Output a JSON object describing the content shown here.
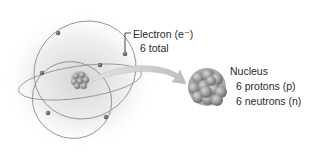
{
  "diagram": {
    "electron_label": {
      "title": "Electron (e⁻)",
      "count": "6 total"
    },
    "nucleus_label": {
      "title": "Nucleus",
      "protons": "6 protons (p)",
      "neutrons": "6 neutrons (n)"
    },
    "colors": {
      "orbit": "#8a8a8a",
      "electron": "#6b6b6b",
      "nucleus_particle": "#9a9a9a",
      "arrow": "#c4c4c4",
      "glow": "#d9d9d9",
      "text": "#2a2a2a"
    },
    "electrons_count": 6
  }
}
